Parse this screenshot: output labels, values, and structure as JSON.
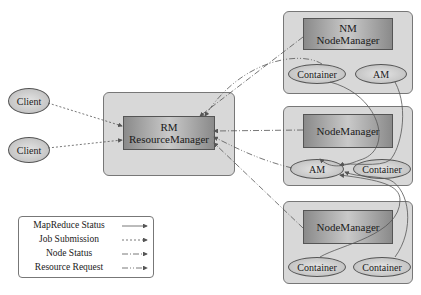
{
  "clients": [
    {
      "label": "Client"
    },
    {
      "label": "Client"
    }
  ],
  "resource_manager": {
    "abbr": "RM",
    "label": "ResourceManager"
  },
  "nodes": [
    {
      "abbr": "NM",
      "label": "NodeManager",
      "left": "Container",
      "right": "AM"
    },
    {
      "abbr": "",
      "label": "NodeManager",
      "left": "AM",
      "right": "Container"
    },
    {
      "abbr": "",
      "label": "NodeManager",
      "left": "Container",
      "right": "Container"
    }
  ],
  "legend": {
    "items": [
      {
        "label": "MapReduce Status",
        "style": "solid"
      },
      {
        "label": "Job Submission",
        "style": "dashed"
      },
      {
        "label": "Node Status",
        "style": "dash-dot"
      },
      {
        "label": "Resource Request",
        "style": "dash-dot-dot"
      }
    ]
  },
  "colors": {
    "panel": "#d8d8d8",
    "border": "#777777",
    "line": "#555555"
  }
}
